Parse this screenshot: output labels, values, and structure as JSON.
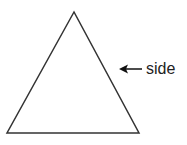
{
  "diagram": {
    "shape": "equilateral-triangle",
    "vertices": {
      "apex": [
        74,
        12
      ],
      "bottom_left": [
        7,
        133
      ],
      "bottom_right": [
        139,
        133
      ]
    },
    "stroke_color": "#333333",
    "annotation": {
      "label": "side",
      "arrow_points_to": "right-side",
      "arrow_from": [
        142,
        69
      ],
      "arrow_to": [
        120,
        69
      ]
    }
  }
}
